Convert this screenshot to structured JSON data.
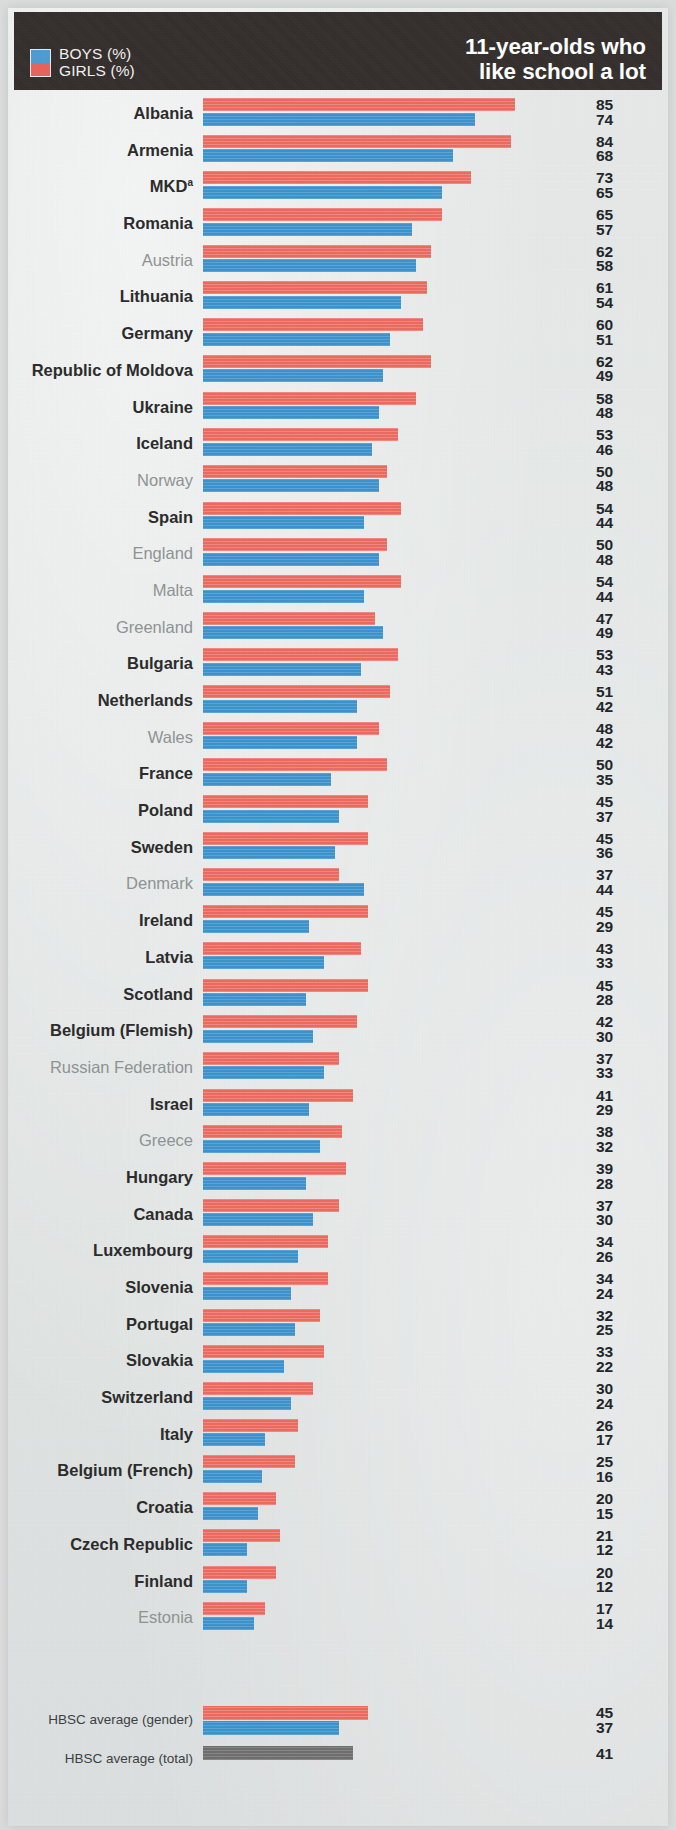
{
  "header": {
    "title_line1": "11-year-olds who",
    "title_line2": "like school a lot",
    "legend": [
      {
        "key": "boys",
        "label": "BOYS (%)",
        "color": "#4f9bd0"
      },
      {
        "key": "girls",
        "label": "GIRLS (%)",
        "color": "#e8635c"
      }
    ],
    "background_color": "#332e2b"
  },
  "averages": {
    "gender_label": "HBSC average (gender)",
    "total_label": "HBSC average (total)",
    "girls": 45,
    "boys": 37,
    "total": 41,
    "total_color": "#6e6e6e"
  },
  "chart_data": {
    "type": "bar",
    "orientation": "horizontal",
    "title": "11-year-olds who like school a lot",
    "xlabel": "",
    "ylabel": "",
    "grid": false,
    "legend_position": "top-left",
    "xlim": [
      0,
      85
    ],
    "value_unit": "%",
    "categories": [
      "Albania",
      "Armenia",
      "MKD",
      "Romania",
      "Austria",
      "Lithuania",
      "Germany",
      "Republic of Moldova",
      "Ukraine",
      "Iceland",
      "Norway",
      "Spain",
      "England",
      "Malta",
      "Greenland",
      "Bulgaria",
      "Netherlands",
      "Wales",
      "France",
      "Poland",
      "Sweden",
      "Denmark",
      "Ireland",
      "Latvia",
      "Scotland",
      "Belgium (Flemish)",
      "Russian Federation",
      "Israel",
      "Greece",
      "Hungary",
      "Canada",
      "Luxembourg",
      "Slovenia",
      "Portugal",
      "Slovakia",
      "Switzerland",
      "Italy",
      "Belgium (French)",
      "Croatia",
      "Czech Republic",
      "Finland",
      "Estonia"
    ],
    "series": [
      {
        "name": "GIRLS (%)",
        "color": "#ec6a60",
        "values": [
          85,
          84,
          73,
          65,
          62,
          61,
          60,
          62,
          58,
          53,
          50,
          54,
          50,
          54,
          47,
          53,
          51,
          48,
          50,
          45,
          45,
          37,
          45,
          43,
          45,
          42,
          37,
          41,
          38,
          39,
          37,
          34,
          34,
          32,
          33,
          30,
          26,
          25,
          20,
          21,
          20,
          17
        ]
      },
      {
        "name": "BOYS (%)",
        "color": "#3d92cd",
        "values": [
          74,
          68,
          65,
          57,
          58,
          54,
          51,
          49,
          48,
          46,
          48,
          44,
          48,
          44,
          49,
          43,
          42,
          42,
          35,
          37,
          36,
          44,
          29,
          33,
          28,
          30,
          33,
          29,
          32,
          28,
          30,
          26,
          24,
          25,
          22,
          24,
          17,
          16,
          15,
          12,
          12,
          14
        ]
      }
    ],
    "rows": [
      {
        "name": "Albania",
        "sup": "",
        "emphasis": "bold",
        "girls": 85,
        "boys": 74
      },
      {
        "name": "Armenia",
        "sup": "",
        "emphasis": "bold",
        "girls": 84,
        "boys": 68
      },
      {
        "name": "MKD",
        "sup": "a",
        "emphasis": "bold",
        "girls": 73,
        "boys": 65
      },
      {
        "name": "Romania",
        "sup": "",
        "emphasis": "bold",
        "girls": 65,
        "boys": 57
      },
      {
        "name": "Austria",
        "sup": "",
        "emphasis": "light",
        "girls": 62,
        "boys": 58
      },
      {
        "name": "Lithuania",
        "sup": "",
        "emphasis": "bold",
        "girls": 61,
        "boys": 54
      },
      {
        "name": "Germany",
        "sup": "",
        "emphasis": "bold",
        "girls": 60,
        "boys": 51
      },
      {
        "name": "Republic of Moldova",
        "sup": "",
        "emphasis": "bold",
        "girls": 62,
        "boys": 49
      },
      {
        "name": "Ukraine",
        "sup": "",
        "emphasis": "bold",
        "girls": 58,
        "boys": 48
      },
      {
        "name": "Iceland",
        "sup": "",
        "emphasis": "bold",
        "girls": 53,
        "boys": 46
      },
      {
        "name": "Norway",
        "sup": "",
        "emphasis": "light",
        "girls": 50,
        "boys": 48
      },
      {
        "name": "Spain",
        "sup": "",
        "emphasis": "bold",
        "girls": 54,
        "boys": 44
      },
      {
        "name": "England",
        "sup": "",
        "emphasis": "light",
        "girls": 50,
        "boys": 48
      },
      {
        "name": "Malta",
        "sup": "",
        "emphasis": "light",
        "girls": 54,
        "boys": 44
      },
      {
        "name": "Greenland",
        "sup": "",
        "emphasis": "light",
        "girls": 47,
        "boys": 49
      },
      {
        "name": "Bulgaria",
        "sup": "",
        "emphasis": "bold",
        "girls": 53,
        "boys": 43
      },
      {
        "name": "Netherlands",
        "sup": "",
        "emphasis": "bold",
        "girls": 51,
        "boys": 42
      },
      {
        "name": "Wales",
        "sup": "",
        "emphasis": "light",
        "girls": 48,
        "boys": 42
      },
      {
        "name": "France",
        "sup": "",
        "emphasis": "bold",
        "girls": 50,
        "boys": 35
      },
      {
        "name": "Poland",
        "sup": "",
        "emphasis": "bold",
        "girls": 45,
        "boys": 37
      },
      {
        "name": "Sweden",
        "sup": "",
        "emphasis": "bold",
        "girls": 45,
        "boys": 36
      },
      {
        "name": "Denmark",
        "sup": "",
        "emphasis": "light",
        "girls": 37,
        "boys": 44
      },
      {
        "name": "Ireland",
        "sup": "",
        "emphasis": "bold",
        "girls": 45,
        "boys": 29
      },
      {
        "name": "Latvia",
        "sup": "",
        "emphasis": "bold",
        "girls": 43,
        "boys": 33
      },
      {
        "name": "Scotland",
        "sup": "",
        "emphasis": "bold",
        "girls": 45,
        "boys": 28
      },
      {
        "name": "Belgium (Flemish)",
        "sup": "",
        "emphasis": "bold",
        "girls": 42,
        "boys": 30
      },
      {
        "name": "Russian Federation",
        "sup": "",
        "emphasis": "light",
        "girls": 37,
        "boys": 33
      },
      {
        "name": "Israel",
        "sup": "",
        "emphasis": "bold",
        "girls": 41,
        "boys": 29
      },
      {
        "name": "Greece",
        "sup": "",
        "emphasis": "light",
        "girls": 38,
        "boys": 32
      },
      {
        "name": "Hungary",
        "sup": "",
        "emphasis": "bold",
        "girls": 39,
        "boys": 28
      },
      {
        "name": "Canada",
        "sup": "",
        "emphasis": "bold",
        "girls": 37,
        "boys": 30
      },
      {
        "name": "Luxembourg",
        "sup": "",
        "emphasis": "bold",
        "girls": 34,
        "boys": 26
      },
      {
        "name": "Slovenia",
        "sup": "",
        "emphasis": "bold",
        "girls": 34,
        "boys": 24
      },
      {
        "name": "Portugal",
        "sup": "",
        "emphasis": "bold",
        "girls": 32,
        "boys": 25
      },
      {
        "name": "Slovakia",
        "sup": "",
        "emphasis": "bold",
        "girls": 33,
        "boys": 22
      },
      {
        "name": "Switzerland",
        "sup": "",
        "emphasis": "bold",
        "girls": 30,
        "boys": 24
      },
      {
        "name": "Italy",
        "sup": "",
        "emphasis": "bold",
        "girls": 26,
        "boys": 17
      },
      {
        "name": "Belgium (French)",
        "sup": "",
        "emphasis": "bold",
        "girls": 25,
        "boys": 16
      },
      {
        "name": "Croatia",
        "sup": "",
        "emphasis": "bold",
        "girls": 20,
        "boys": 15
      },
      {
        "name": "Czech Republic",
        "sup": "",
        "emphasis": "bold",
        "girls": 21,
        "boys": 12
      },
      {
        "name": "Finland",
        "sup": "",
        "emphasis": "bold",
        "girls": 20,
        "boys": 12
      },
      {
        "name": "Estonia",
        "sup": "",
        "emphasis": "light",
        "girls": 17,
        "boys": 14
      }
    ]
  }
}
